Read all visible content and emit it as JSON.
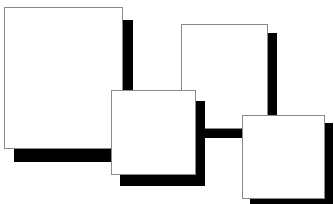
{
  "canvas": {
    "width": 334,
    "height": 204,
    "background": "#ffffff"
  },
  "colors": {
    "card_fill": "#ffffff",
    "card_border": "#8a8a8a",
    "shadow": "#000000"
  },
  "cards": [
    {
      "name": "card-large-left",
      "x": 4,
      "y": 7,
      "w": 119,
      "h": 142,
      "shadow_dx": 10,
      "shadow_dy": 13
    },
    {
      "name": "card-top-right",
      "x": 181,
      "y": 24,
      "w": 87,
      "h": 105,
      "shadow_dx": 9,
      "shadow_dy": 9
    },
    {
      "name": "card-middle-bottom",
      "x": 111,
      "y": 90,
      "w": 85,
      "h": 85,
      "shadow_dx": 9,
      "shadow_dy": 11
    },
    {
      "name": "card-bottom-right",
      "x": 242,
      "y": 115,
      "w": 83,
      "h": 84,
      "shadow_dx": 8,
      "shadow_dy": 8
    }
  ]
}
